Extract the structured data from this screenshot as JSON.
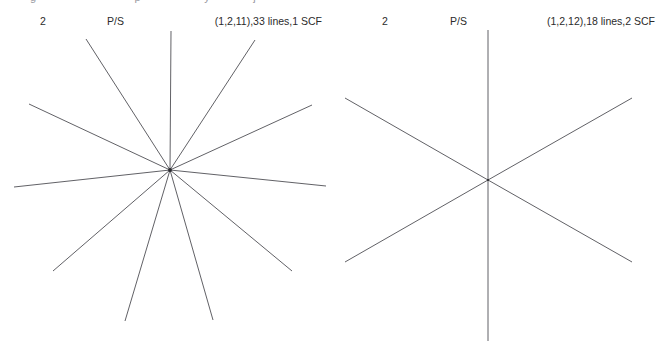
{
  "page": {
    "background_color": "#ffffff",
    "line_color": "#4f4f55",
    "text_color": "#2b2b2b",
    "top_cutoff_fragments": [
      "g",
      "p",
      "y",
      "j"
    ]
  },
  "panels": [
    {
      "id": "left",
      "index_label": "2",
      "type_label": "P/S",
      "caption": "(1,2,11),33 lines,1 SCF"
    },
    {
      "id": "right",
      "index_label": "2",
      "type_label": "P/S",
      "caption": "(1,2,12),18 lines,2 SCF"
    }
  ],
  "chart_data": [
    {
      "type": "line",
      "id": "left-starburst",
      "title": "(1,2,11),33 lines,1 SCF",
      "index_label": "2",
      "type_label": "P/S",
      "xlabel": "",
      "ylabel": "",
      "grid": false,
      "legend": "none",
      "center": [
        170,
        170
      ],
      "line_count": 11,
      "scf_count": 1,
      "total_lines_reported": 33,
      "triple": [
        1,
        2,
        11
      ],
      "rays": [
        {
          "name": "ray-up-vertical",
          "angle_deg": 90,
          "x1": 170,
          "y1": 170,
          "x2": 171,
          "y2": 31
        },
        {
          "name": "ray-upleft-steep",
          "angle_deg": 129,
          "x1": 170,
          "y1": 170,
          "x2": 86,
          "y2": 39
        },
        {
          "name": "ray-upleft-shallow",
          "angle_deg": 162,
          "x1": 170,
          "y1": 170,
          "x2": 29,
          "y2": 104
        },
        {
          "name": "ray-left-horizontal",
          "angle_deg": 185,
          "x1": 170,
          "y1": 170,
          "x2": 14,
          "y2": 187
        },
        {
          "name": "ray-downleft-shallow",
          "angle_deg": 218,
          "x1": 170,
          "y1": 170,
          "x2": 53,
          "y2": 271
        },
        {
          "name": "ray-down-left-steep",
          "angle_deg": 256,
          "x1": 170,
          "y1": 170,
          "x2": 125,
          "y2": 321
        },
        {
          "name": "ray-down-right-steep",
          "angle_deg": 285,
          "x1": 170,
          "y1": 170,
          "x2": 213,
          "y2": 320
        },
        {
          "name": "ray-downright-shallow",
          "angle_deg": 322,
          "x1": 170,
          "y1": 170,
          "x2": 292,
          "y2": 271
        },
        {
          "name": "ray-right-horizontal",
          "angle_deg": 356,
          "x1": 170,
          "y1": 170,
          "x2": 326,
          "y2": 186
        },
        {
          "name": "ray-upright-shallow",
          "angle_deg": 22,
          "x1": 170,
          "y1": 170,
          "x2": 312,
          "y2": 105
        },
        {
          "name": "ray-upright-steep",
          "angle_deg": 57,
          "x1": 170,
          "y1": 170,
          "x2": 255,
          "y2": 40
        }
      ]
    },
    {
      "type": "line",
      "id": "right-six-ray",
      "title": "(1,2,12),18 lines,2 SCF",
      "index_label": "2",
      "type_label": "P/S",
      "xlabel": "",
      "ylabel": "",
      "grid": false,
      "legend": "none",
      "center": [
        488,
        180
      ],
      "line_count": 3,
      "scf_count": 2,
      "total_lines_reported": 18,
      "triple": [
        1,
        2,
        12
      ],
      "rays": [
        {
          "name": "ray-up-vertical",
          "angle_deg": 90,
          "x1": 488,
          "y1": 180,
          "x2": 488,
          "y2": 30
        },
        {
          "name": "ray-down-vertical",
          "angle_deg": 270,
          "x1": 488,
          "y1": 180,
          "x2": 488,
          "y2": 341
        },
        {
          "name": "ray-upleft",
          "angle_deg": 152,
          "x1": 488,
          "y1": 180,
          "x2": 345,
          "y2": 98
        },
        {
          "name": "ray-downright",
          "angle_deg": 332,
          "x1": 488,
          "y1": 180,
          "x2": 632,
          "y2": 262
        },
        {
          "name": "ray-upright",
          "angle_deg": 28,
          "x1": 488,
          "y1": 180,
          "x2": 632,
          "y2": 98
        },
        {
          "name": "ray-downleft",
          "angle_deg": 208,
          "x1": 488,
          "y1": 180,
          "x2": 345,
          "y2": 262
        }
      ]
    }
  ]
}
